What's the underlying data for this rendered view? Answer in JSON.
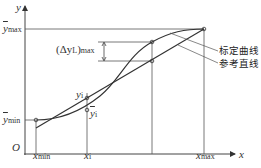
{
  "diagram": {
    "axes": {
      "y_label": "y",
      "x_label": "x",
      "origin_label": "O"
    },
    "y_labels": {
      "ymax": {
        "base": "y",
        "sub": "max"
      },
      "ymin": {
        "base": "y",
        "sub": "min"
      }
    },
    "x_labels": {
      "xmin": {
        "base": "x",
        "sub": "min"
      },
      "xi": {
        "base": "x",
        "sub": "i"
      },
      "xmax": {
        "base": "x",
        "sub": "max"
      }
    },
    "point_labels": {
      "yi": {
        "base": "y",
        "sub": "i"
      },
      "ybar_i": {
        "base": "y",
        "sub": "i"
      }
    },
    "delta": {
      "prefix": "(Δy",
      "sub1": "L",
      "suffix": ")",
      "sub2": "max"
    },
    "legend": {
      "calibration_curve": "标定曲线",
      "reference_line": "参考直线"
    },
    "colors": {
      "line": "#333333",
      "thin": "#555555"
    }
  }
}
